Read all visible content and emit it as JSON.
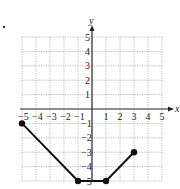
{
  "chart_data": {
    "type": "line",
    "title": "",
    "xlabel": "x",
    "ylabel": "y",
    "xlim": [
      -5,
      5
    ],
    "ylim": [
      -5,
      5
    ],
    "grid": true,
    "x_ticks": [
      "-5",
      "-4",
      "-3",
      "-2",
      "-1",
      "1",
      "2",
      "3",
      "4",
      "5"
    ],
    "y_ticks": [
      "5",
      "4",
      "3",
      "2",
      "1",
      "-1",
      "-2",
      "-3",
      "-4",
      "-5"
    ],
    "series": [
      {
        "name": "piecewise linear graph",
        "points": [
          [
            -5,
            -1
          ],
          [
            -1,
            -5
          ],
          [
            1,
            -5
          ],
          [
            3,
            -3
          ]
        ],
        "closed_endpoints": true
      }
    ],
    "colors": {
      "line": "#111111",
      "grid": "#8a8a8a",
      "axis": "#222222"
    }
  },
  "labels": {
    "x_axis": "x",
    "y_axis": "y"
  }
}
